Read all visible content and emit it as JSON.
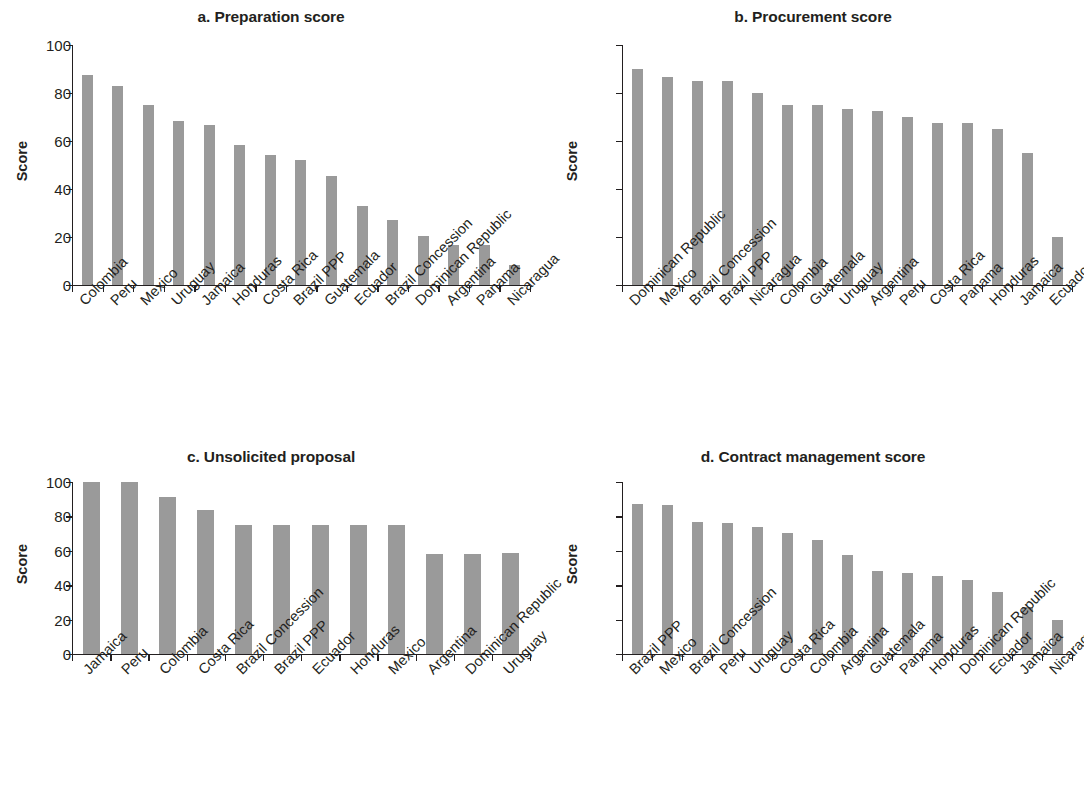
{
  "figure": {
    "ylabel": "Score",
    "y_ticks": [
      0,
      20,
      40,
      60,
      80,
      100
    ],
    "bar_color": "#9a9a9a",
    "axis_color": "#231f20"
  },
  "chart_data": [
    {
      "type": "bar",
      "panel": "a",
      "title": "a. Preparation score",
      "xlabel": "",
      "ylabel": "Score",
      "ylim": [
        0,
        100
      ],
      "yticks": [
        0,
        20,
        40,
        60,
        80,
        100
      ],
      "grid": false,
      "legend": "none",
      "categories": [
        "Colombia",
        "Peru",
        "Mexico",
        "Uruguay",
        "Jamaica",
        "Honduras",
        "Costa Rica",
        "Brazil PPP",
        "Guatemala",
        "Ecuador",
        "Brazil Concession",
        "Dominican Republic",
        "Argentina",
        "Panama",
        "Nicaragua"
      ],
      "values": [
        87.5,
        83,
        75,
        68.5,
        66.5,
        58.5,
        54,
        52,
        45.5,
        33,
        27,
        20.5,
        16.5,
        16.5,
        8.5
      ]
    },
    {
      "type": "bar",
      "panel": "b",
      "title": "b. Procurement score",
      "xlabel": "",
      "ylabel": "Score",
      "ylim": [
        0,
        100
      ],
      "yticks": [
        0,
        20,
        40,
        60,
        80,
        100
      ],
      "grid": false,
      "legend": "none",
      "categories": [
        "Dominican Republic",
        "Mexico",
        "Brazil Concession",
        "Brazil PPP",
        "Nicaragua",
        "Colombia",
        "Guatemala",
        "Uruguay",
        "Argentina",
        "Peru",
        "Costa Rica",
        "Panama",
        "Honduras",
        "Jamaica",
        "Ecuador"
      ],
      "values": [
        90,
        86.5,
        85,
        85,
        80,
        75,
        75,
        73.5,
        72.5,
        70,
        67.5,
        67.5,
        65,
        55,
        20
      ]
    },
    {
      "type": "bar",
      "panel": "c",
      "title": "c. Unsolicited proposal",
      "xlabel": "",
      "ylabel": "Score",
      "ylim": [
        0,
        100
      ],
      "yticks": [
        0,
        20,
        40,
        60,
        80,
        100
      ],
      "grid": false,
      "legend": "none",
      "categories": [
        "Jamaica",
        "Peru",
        "Colombia",
        "Costa Rica",
        "Brazil Concession",
        "Brazil PPP",
        "Ecuador",
        "Honduras",
        "Mexico",
        "Argentina",
        "Dominican Republic",
        "Uruguay"
      ],
      "values": [
        100,
        100,
        91.5,
        83.5,
        75,
        75,
        75,
        75,
        75,
        58,
        58,
        58.5
      ]
    },
    {
      "type": "bar",
      "panel": "d",
      "title": "d. Contract management score",
      "xlabel": "",
      "ylabel": "Score",
      "ylim": [
        0,
        100
      ],
      "yticks": [
        0,
        20,
        40,
        60,
        80,
        100
      ],
      "grid": false,
      "legend": "none",
      "categories": [
        "Brazil PPP",
        "Mexico",
        "Brazil Concession",
        "Peru",
        "Uruguay",
        "Costa Rica",
        "Colombia",
        "Argentina",
        "Guatemala",
        "Panama",
        "Honduras",
        "Dominican Republic",
        "Ecuador",
        "Jamaica",
        "Nicaragua"
      ],
      "values": [
        87.5,
        86.5,
        77,
        76,
        74,
        70.5,
        66,
        57.5,
        48.5,
        47,
        45.5,
        43,
        36,
        27.5,
        20
      ]
    }
  ]
}
